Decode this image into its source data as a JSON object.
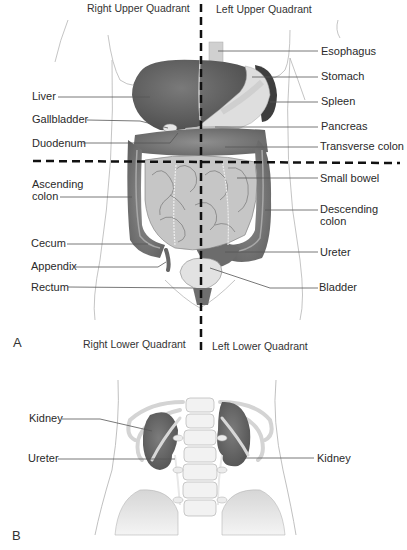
{
  "figure_a": {
    "panel_label": "A",
    "quadrants": {
      "right_upper": "Right Upper Quadrant",
      "left_upper": "Left Upper Quadrant",
      "right_lower": "Right Lower Quadrant",
      "left_lower": "Left Lower Quadrant"
    },
    "left_labels": [
      {
        "text": "Liver"
      },
      {
        "text": "Gallbladder"
      },
      {
        "text": "Duodenum"
      },
      {
        "text": "Ascending"
      },
      {
        "text": "colon"
      },
      {
        "text": "Cecum"
      },
      {
        "text": "Appendix"
      },
      {
        "text": "Rectum"
      }
    ],
    "right_labels": [
      {
        "text": "Esophagus"
      },
      {
        "text": "Stomach"
      },
      {
        "text": "Spleen"
      },
      {
        "text": "Pancreas"
      },
      {
        "text": "Transverse colon"
      },
      {
        "text": "Small bowel"
      },
      {
        "text": "Descending"
      },
      {
        "text": "colon"
      },
      {
        "text": "Ureter"
      },
      {
        "text": "Bladder"
      }
    ]
  },
  "figure_b": {
    "panel_label": "B",
    "left_labels": [
      {
        "text": "Kidney"
      },
      {
        "text": "Ureter"
      }
    ],
    "right_labels": [
      {
        "text": "Kidney"
      }
    ]
  },
  "colors": {
    "organ_dark": "#5a5a5a",
    "organ_mid": "#8a8a8a",
    "organ_light": "#c8c8c8",
    "organ_pale": "#e2e2e2",
    "outline": "#9a9a9a",
    "leader": "#555555",
    "dash": "#111111"
  }
}
